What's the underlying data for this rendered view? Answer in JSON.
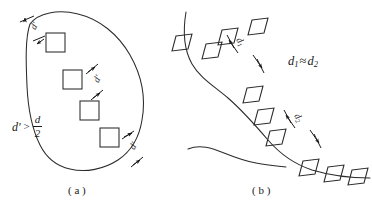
{
  "figure": {
    "panels": [
      {
        "id": "a",
        "caption": "( a )",
        "relation": {
          "symbol_left": "d",
          "prime": "'",
          "operator": ">",
          "numerator": "d",
          "denominator": "2"
        },
        "dimension_label": "d'",
        "shape_kind": "closed-blob",
        "marker_kind": "square",
        "marker_count": 4,
        "dimension_count": 4
      },
      {
        "id": "b",
        "caption": "( b )",
        "relation": {
          "symbol_left": "d",
          "subscript_left": "1",
          "operator": "≈",
          "symbol_right": "d",
          "subscript_right": "2"
        },
        "dimension_labels": [
          {
            "base": "d",
            "sub": "1"
          },
          {
            "base": "d",
            "sub": "2"
          }
        ],
        "shape_kind": "open-curve",
        "marker_kind": "parallelogram",
        "marker_count": 11,
        "dimension_count": 2
      }
    ],
    "figure_caption": "",
    "colors": {
      "ink": "#2b2b2b",
      "annotation_ink": "#1a1a1a",
      "background": "#ffffff",
      "faded_caption": "#b9b9b9"
    }
  }
}
